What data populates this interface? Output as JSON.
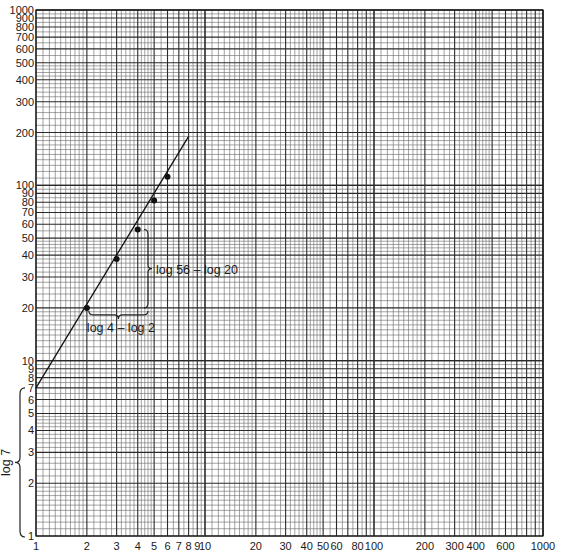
{
  "chart_data": {
    "type": "scatter",
    "title": "",
    "xlabel": "",
    "ylabel": "",
    "xscale": "log",
    "yscale": "log",
    "xlim": [
      1,
      1000
    ],
    "ylim": [
      1,
      1000
    ],
    "grid": true,
    "x_tick_labels": [
      "1",
      "2",
      "3",
      "4",
      "5",
      "6",
      "7",
      "8",
      "9",
      "10",
      "20",
      "30",
      "40",
      "50",
      "60",
      "80",
      "100",
      "200",
      "300",
      "400",
      "600",
      "1000"
    ],
    "x_tick_values": [
      1,
      2,
      3,
      4,
      5,
      6,
      7,
      8,
      9,
      10,
      20,
      30,
      40,
      50,
      60,
      80,
      100,
      200,
      300,
      400,
      600,
      1000
    ],
    "y_tick_labels": [
      "1",
      "2",
      "3",
      "4",
      "5",
      "6",
      "7",
      "8",
      "9",
      "10",
      "20",
      "30",
      "40",
      "50",
      "60",
      "70",
      "80",
      "90",
      "100",
      "200",
      "300",
      "400",
      "500",
      "600",
      "700",
      "800",
      "900",
      "1000"
    ],
    "y_tick_values": [
      1,
      2,
      3,
      4,
      5,
      6,
      7,
      8,
      9,
      10,
      20,
      30,
      40,
      50,
      60,
      70,
      80,
      90,
      100,
      200,
      300,
      400,
      500,
      600,
      700,
      800,
      900,
      1000
    ],
    "series": [
      {
        "name": "data points",
        "x": [
          2,
          3,
          4,
          5,
          6
        ],
        "y": [
          20,
          38,
          56,
          82,
          112
        ]
      },
      {
        "name": "fitted line",
        "type": "line",
        "x": [
          1,
          8
        ],
        "y": [
          7,
          190
        ]
      }
    ],
    "annotations": [
      {
        "text": "log 56 – log 20",
        "kind": "vertical-brace",
        "from_y": 20,
        "to_y": 56,
        "at_x": 4
      },
      {
        "text": "log 4 – log 2",
        "kind": "horizontal-brace",
        "from_x": 2,
        "to_x": 4,
        "at_y": 20
      },
      {
        "text": "log 7",
        "kind": "left-brace",
        "from_y": 1,
        "to_y": 7
      }
    ]
  },
  "labels": {
    "rise": "log 56 – log 20",
    "run": "log 4 – log 2",
    "intercept": "log 7"
  },
  "plot": {
    "left": 36,
    "right": 543,
    "top": 10,
    "bottom": 536,
    "grid_color": "#2a2a2a",
    "line_color": "#111111"
  }
}
